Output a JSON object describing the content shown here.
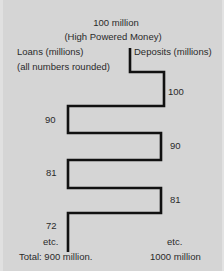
{
  "header": {
    "amount": "100 million",
    "subtitle": "(High Powered Money)"
  },
  "left_column": {
    "title": "Loans (millions)",
    "note": "(all numbers rounded)",
    "values": [
      "90",
      "81",
      "72"
    ],
    "etc": "etc.",
    "total": "Total: 900 million."
  },
  "right_column": {
    "title": "Deposits (millions)",
    "values": [
      "100",
      "90",
      "81"
    ],
    "etc": "etc.",
    "total": "1000 million"
  },
  "colors": {
    "background": "#d5d5d5",
    "line": "#111111",
    "text": "#2a2a2a"
  }
}
